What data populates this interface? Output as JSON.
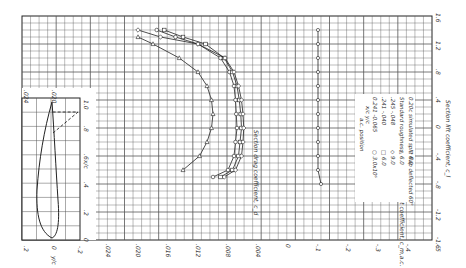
{
  "chart_data": [
    {
      "type": "line",
      "title": "Section drag coefficient vs section lift coefficient",
      "xlabel": "Section lift coefficient, c_l",
      "ylabel": "Section drag coefficient, c_d",
      "xlim": [
        -1.6,
        1.6
      ],
      "ylim": [
        0,
        0.024
      ],
      "x_ticks": [
        "-1.6",
        "-1.2",
        "-.8",
        "-.4",
        "0",
        ".4",
        ".8",
        "1.2",
        "1.6"
      ],
      "y_ticks": [
        ".024",
        ".020",
        ".016",
        ".012",
        ".008",
        ".004",
        "0"
      ],
      "orientation": "rotated 90 degrees",
      "series": [
        {
          "name": "R=3.0x10^6",
          "marker": "circle",
          "x": [
            -0.7,
            -0.6,
            -0.4,
            -0.2,
            0,
            0.2,
            0.4,
            0.6,
            0.8,
            1.0,
            1.2,
            1.3,
            1.4
          ],
          "y": [
            0.01,
            0.008,
            0.0072,
            0.007,
            0.0068,
            0.0069,
            0.007,
            0.0072,
            0.0078,
            0.009,
            0.012,
            0.015,
            0.0175
          ]
        },
        {
          "name": "R=6.0x10^6",
          "marker": "square",
          "x": [
            -0.7,
            -0.6,
            -0.4,
            -0.2,
            0,
            0.2,
            0.4,
            0.6,
            0.8,
            1.0,
            1.2,
            1.3,
            1.4
          ],
          "y": [
            0.009,
            0.0074,
            0.0066,
            0.0064,
            0.0062,
            0.0063,
            0.0065,
            0.0068,
            0.0074,
            0.0085,
            0.011,
            0.014,
            0.0165
          ]
        },
        {
          "name": "R=9.0x10^6",
          "marker": "diamond",
          "x": [
            -0.7,
            -0.6,
            -0.4,
            -0.2,
            0,
            0.2,
            0.4,
            0.6,
            0.8,
            1.0,
            1.2,
            1.3,
            1.4
          ],
          "y": [
            0.0085,
            0.007,
            0.0062,
            0.006,
            0.0059,
            0.006,
            0.0062,
            0.0066,
            0.0072,
            0.0084,
            0.012,
            0.017,
            0.02
          ]
        },
        {
          "name": "R=6.0x10^6 Standard roughness",
          "marker": "triangle",
          "x": [
            -0.6,
            -0.4,
            -0.2,
            0,
            0.2,
            0.4,
            0.6,
            0.8,
            1.0,
            1.2,
            1.3
          ],
          "y": [
            0.014,
            0.0118,
            0.0108,
            0.0102,
            0.01,
            0.0102,
            0.0108,
            0.012,
            0.0145,
            0.018,
            0.02
          ]
        }
      ]
    },
    {
      "type": "line",
      "title": "Moment coefficient vs section lift coefficient",
      "xlabel": "Section lift coefficient, c_l",
      "ylabel": "Moment coefficient, c_m_ac",
      "xlim": [
        -1.6,
        1.6
      ],
      "ylim": [
        -0.5,
        0
      ],
      "y_ticks": [
        "0",
        "-.1",
        "-.2",
        "-.3",
        "-.4",
        "-.5"
      ],
      "series": [
        {
          "name": "c_m_ac (all R)",
          "x": [
            -0.8,
            -0.6,
            -0.4,
            -0.2,
            0,
            0.2,
            0.4,
            0.6,
            0.8,
            1.0,
            1.2,
            1.4
          ],
          "y": [
            -0.11,
            -0.1,
            -0.1,
            -0.1,
            -0.1,
            -0.1,
            -0.1,
            -0.1,
            -0.1,
            -0.1,
            -0.1,
            -0.1
          ]
        }
      ]
    },
    {
      "type": "line",
      "title": "Airfoil section profile",
      "xlabel": "x/c",
      "ylabel": "y/c",
      "xlim": [
        0,
        1.0
      ],
      "ylim": [
        -0.2,
        0.2
      ],
      "x_ticks": [
        "0",
        ".2",
        ".4",
        ".6",
        ".8",
        "1.0"
      ],
      "y_ticks": [
        ".2",
        "0",
        "-.2"
      ],
      "annotation": "0.20c simulated split flap deflected 60 deg (dashed)"
    }
  ],
  "legend": {
    "header_R": "R",
    "header_ac": "a.c. position",
    "header_xc": "x/c",
    "header_yc": "y/c",
    "rows": [
      {
        "symbol": "○",
        "R": "3.0x10⁶",
        "xc": "0.241",
        "yc": "-0.065"
      },
      {
        "symbol": "□",
        "R": "6.0",
        "xc": ".241",
        "yc": "-.040"
      },
      {
        "symbol": "◇",
        "R": "9.0",
        "xc": ".245",
        "yc": "-.048"
      },
      {
        "symbol": "△",
        "R": "6.0",
        "xc": "Standard roughness",
        "yc": ""
      },
      {
        "symbol": "▽",
        "R": "6.0",
        "xc": "0.20c simulated split flap deflected 60°",
        "yc": ""
      }
    ]
  },
  "axes_labels": {
    "cl": "Section lift coefficient, c_l",
    "cd": "Section drag coefficient, c_d",
    "cm": "Moment coefficient, c_m,a.c.",
    "xc": "x/c",
    "yc": "y/c"
  }
}
